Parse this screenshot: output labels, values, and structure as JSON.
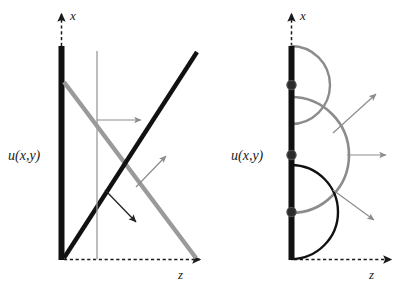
{
  "figure": {
    "title": "",
    "background_color": "#ffffff",
    "width": 395,
    "height": 286,
    "colors": {
      "black": "#111111",
      "gray": "#9a9a9a",
      "mid_gray": "#8c8c8c",
      "dark_gray": "#4d4d4d",
      "white": "#ffffff"
    },
    "panels": [
      {
        "id": "left-panel",
        "name": "plane-wave-panel",
        "description": "Plane wave rays reflecting at a boundary",
        "axes": {
          "x_axis": {
            "label": "x",
            "label_x": 67,
            "label_y": 16,
            "style": "dashed-with-arrow",
            "direction": "up"
          },
          "z_axis": {
            "label": "z",
            "label_x": 179,
            "label_y": 276,
            "style": "dashed-with-arrow",
            "direction": "right"
          }
        },
        "boundary": {
          "label": "u(x,y)",
          "label_x": 8,
          "label_y": 155,
          "bar_color": "#111111",
          "bar_x": 61,
          "bar_top": 46,
          "bar_bottom": 260,
          "bar_width": 6
        },
        "rays": [
          {
            "name": "incoming-gray-ray",
            "color": "#9a9a9a",
            "width": 4.2,
            "x1": 64,
            "y1": 82,
            "x2": 196,
            "y2": 258
          },
          {
            "name": "outgoing-black-ray",
            "color": "#111111",
            "width": 4.2,
            "x1": 64,
            "y1": 258,
            "x2": 197,
            "y2": 52
          }
        ],
        "vertical_guide": {
          "name": "vertical-gray-guide",
          "color": "#9a9a9a",
          "width": 1.3,
          "x": 97,
          "y1": 51,
          "y2": 259
        },
        "arrows": [
          {
            "name": "horizontal-gray-arrow",
            "color": "#8c8c8c",
            "width": 1.2,
            "x1": 97,
            "y1": 120,
            "x2": 143,
            "y2": 120
          },
          {
            "name": "diagonal-gray-arrow-up",
            "color": "#8c8c8c",
            "width": 1.1,
            "x1": 137,
            "y1": 186,
            "x2": 167,
            "y2": 155
          },
          {
            "name": "diagonal-black-arrow-down",
            "color": "#222222",
            "width": 1.2,
            "x1": 105,
            "y1": 190,
            "x2": 138,
            "y2": 224
          }
        ]
      },
      {
        "id": "right-panel",
        "name": "huygens-wavelets-panel",
        "description": "Huygens point sources emitting semicircular wavelets",
        "axes": {
          "x_axis": {
            "label": "x",
            "label_x": 298,
            "label_y": 16,
            "style": "dashed-with-arrow",
            "direction": "up"
          },
          "z_axis": {
            "label": "z",
            "label_x": 370,
            "label_y": 276,
            "style": "dashed-with-arrow",
            "direction": "right"
          }
        },
        "boundary": {
          "label": "u(x,y)",
          "label_x": 231,
          "label_y": 155,
          "bar_color": "#111111",
          "bar_x": 288,
          "bar_top": 46,
          "bar_bottom": 260,
          "bar_width": 6
        },
        "wavelets": [
          {
            "name": "wavelet-top-gray",
            "color": "#8c8c8c",
            "width": 2.4,
            "cx": 291,
            "cy": 85,
            "r": 39
          },
          {
            "name": "wavelet-middle-gray",
            "color": "#8c8c8c",
            "width": 2.6,
            "cx": 291,
            "cy": 155,
            "r": 58
          },
          {
            "name": "wavelet-bottom-black",
            "color": "#111111",
            "width": 2.4,
            "cx": 291,
            "cy": 212,
            "r": 47
          }
        ],
        "point_sources": [
          {
            "name": "point-source-top",
            "cx": 291,
            "cy": 85,
            "r": 4.6
          },
          {
            "name": "point-source-middle",
            "cx": 291,
            "cy": 155,
            "r": 4.6
          },
          {
            "name": "point-source-bottom",
            "cx": 291,
            "cy": 212,
            "r": 4.6
          }
        ],
        "arrows": [
          {
            "name": "wavelet-arrow-up-right",
            "color": "#8c8c8c",
            "width": 1.2,
            "x1": 333,
            "y1": 132,
            "x2": 378,
            "y2": 92
          },
          {
            "name": "wavelet-arrow-right",
            "color": "#8c8c8c",
            "width": 1.2,
            "x1": 347,
            "y1": 155,
            "x2": 388,
            "y2": 155
          },
          {
            "name": "wavelet-arrow-down-right",
            "color": "#8c8c8c",
            "width": 1.2,
            "x1": 333,
            "y1": 190,
            "x2": 376,
            "y2": 222
          }
        ]
      }
    ]
  }
}
